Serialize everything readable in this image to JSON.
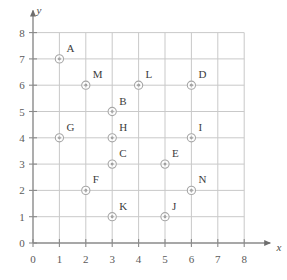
{
  "chart_data": {
    "type": "scatter",
    "title": "",
    "subtitle": "",
    "xlabel": "x",
    "ylabel": "y",
    "xlim": [
      0,
      8
    ],
    "ylim": [
      0,
      8
    ],
    "xticks": [
      "0",
      "1",
      "2",
      "3",
      "4",
      "5",
      "6",
      "7",
      "8"
    ],
    "yticks": [
      "0",
      "1",
      "2",
      "3",
      "4",
      "5",
      "6",
      "7",
      "8"
    ],
    "grid": true,
    "legend": "none",
    "marker": "circle-with-center-dot",
    "label_position": "upper-right",
    "points": [
      {
        "label": "A",
        "x": 1,
        "y": 7
      },
      {
        "label": "M",
        "x": 2,
        "y": 6
      },
      {
        "label": "L",
        "x": 4,
        "y": 6
      },
      {
        "label": "D",
        "x": 6,
        "y": 6
      },
      {
        "label": "B",
        "x": 3,
        "y": 5
      },
      {
        "label": "G",
        "x": 1,
        "y": 4
      },
      {
        "label": "H",
        "x": 3,
        "y": 4
      },
      {
        "label": "I",
        "x": 6,
        "y": 4
      },
      {
        "label": "C",
        "x": 3,
        "y": 3
      },
      {
        "label": "E",
        "x": 5,
        "y": 3
      },
      {
        "label": "F",
        "x": 2,
        "y": 2
      },
      {
        "label": "N",
        "x": 6,
        "y": 2
      },
      {
        "label": "K",
        "x": 3,
        "y": 1
      },
      {
        "label": "J",
        "x": 5,
        "y": 1
      }
    ]
  },
  "colors": {
    "background": "#ffffff",
    "grid_line": "#c9c9c9",
    "axis_line": "#8a8a8a",
    "tick_text": "#5a5a5a",
    "point_label": "#3c3c3c",
    "marker_stroke": "#9a9a9a"
  }
}
